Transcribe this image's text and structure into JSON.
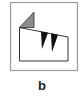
{
  "figure": {
    "label": "b",
    "colors": {
      "frame": "#9a9a9a",
      "outline": "#333333",
      "gray_fill": "#8c8c8c",
      "black_fill": "#111111",
      "background": "#ffffff"
    },
    "elements": [
      {
        "name": "outer-frame",
        "shape": "rectangle"
      },
      {
        "name": "building-outline",
        "shape": "polygon"
      },
      {
        "name": "gray-triangle",
        "shape": "triangle"
      },
      {
        "name": "black-tooth-1",
        "shape": "triangle"
      },
      {
        "name": "black-tooth-2",
        "shape": "triangle"
      }
    ]
  }
}
